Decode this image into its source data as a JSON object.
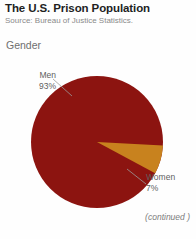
{
  "header": {
    "title": "The U.S. Prison Population",
    "source": "Source: Bureau of Justice Statistics."
  },
  "section": {
    "label": "Gender"
  },
  "footer": {
    "note": "(continued )"
  },
  "colors": {
    "men": "#8c1410",
    "women": "#c8821e",
    "background": "#fefefe",
    "title_text": "#221f1f",
    "muted_text": "#8a8a8a",
    "label_text": "#5f5f5f",
    "leader_line": "#9a9a9a"
  },
  "chart_data": {
    "type": "pie",
    "title": "Gender",
    "categories": [
      "Men",
      "Women"
    ],
    "values": [
      93,
      7
    ],
    "value_labels": [
      "93%",
      "7%"
    ],
    "series": [
      {
        "name": "Men",
        "value": 93,
        "label": "Men",
        "value_label": "93%",
        "color": "#8c1410"
      },
      {
        "name": "Women",
        "value": 7,
        "label": "Women",
        "value_label": "7%",
        "color": "#c8821e"
      }
    ],
    "units": "percent",
    "total": 100,
    "legend": "callout-labels",
    "grid": false,
    "start_angle_deg": 90,
    "direction": "counterclockwise"
  }
}
